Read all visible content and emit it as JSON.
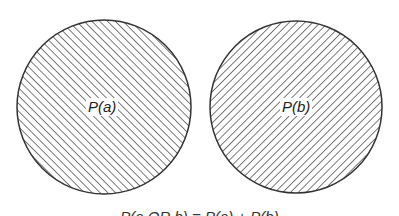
{
  "diagram": {
    "type": "venn-disjoint-events",
    "circles": [
      {
        "id": "a",
        "label": "P(a)",
        "hatch": "backslash"
      },
      {
        "id": "b",
        "label": "P(b)",
        "hatch": "slash"
      }
    ],
    "caption": "P(a OR b) = P(a) + P(b)"
  },
  "colors": {
    "stroke": "#333333",
    "hatch": "#5a5a5a",
    "background": "#ffffff"
  }
}
